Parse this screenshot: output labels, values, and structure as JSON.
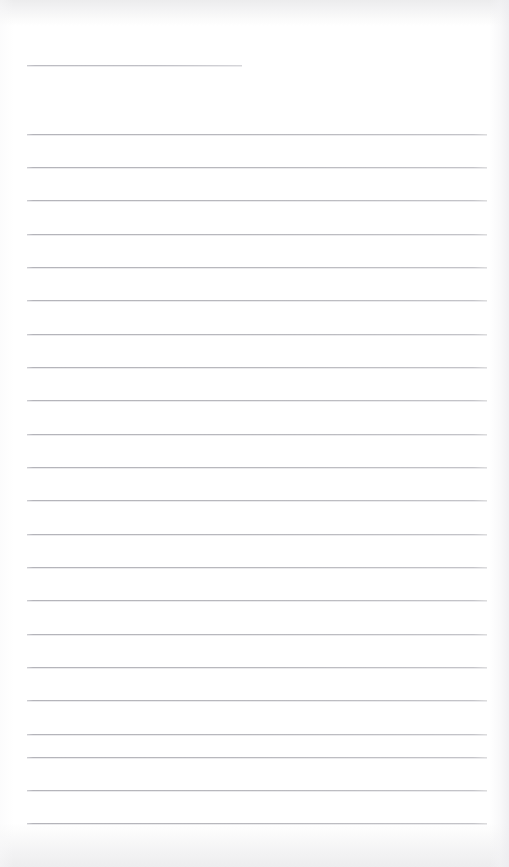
{
  "page": {
    "kind": "lined-paper-sheet",
    "width": 509,
    "height": 867,
    "paper_color": "#ffffff",
    "rule_color": "#b9b9be",
    "edge_shadow_color": "#ededee",
    "content_text": "",
    "is_blank": "true"
  },
  "title_line": {
    "label": "",
    "value": "",
    "placeholder": "",
    "x": 27,
    "y": 65,
    "width": 215
  },
  "rules": {
    "left_margin": 27,
    "right_margin": 487,
    "line_width": 460,
    "spacing": 33.4,
    "first_line_y": 134,
    "count": 22,
    "positions": [
      134,
      167,
      200,
      234,
      267,
      300,
      334,
      367,
      400,
      434,
      467,
      500,
      534,
      567,
      600,
      634,
      667,
      700,
      734,
      757,
      790,
      823
    ]
  },
  "lines": [
    {
      "index": 1,
      "y": 134,
      "text": ""
    },
    {
      "index": 2,
      "y": 167,
      "text": ""
    },
    {
      "index": 3,
      "y": 200,
      "text": ""
    },
    {
      "index": 4,
      "y": 234,
      "text": ""
    },
    {
      "index": 5,
      "y": 267,
      "text": ""
    },
    {
      "index": 6,
      "y": 300,
      "text": ""
    },
    {
      "index": 7,
      "y": 334,
      "text": ""
    },
    {
      "index": 8,
      "y": 367,
      "text": ""
    },
    {
      "index": 9,
      "y": 400,
      "text": ""
    },
    {
      "index": 10,
      "y": 434,
      "text": ""
    },
    {
      "index": 11,
      "y": 467,
      "text": ""
    },
    {
      "index": 12,
      "y": 500,
      "text": ""
    },
    {
      "index": 13,
      "y": 534,
      "text": ""
    },
    {
      "index": 14,
      "y": 567,
      "text": ""
    },
    {
      "index": 15,
      "y": 600,
      "text": ""
    },
    {
      "index": 16,
      "y": 634,
      "text": ""
    },
    {
      "index": 17,
      "y": 667,
      "text": ""
    },
    {
      "index": 18,
      "y": 700,
      "text": ""
    },
    {
      "index": 19,
      "y": 734,
      "text": ""
    },
    {
      "index": 20,
      "y": 757,
      "text": ""
    },
    {
      "index": 21,
      "y": 790,
      "text": ""
    },
    {
      "index": 22,
      "y": 823,
      "text": ""
    }
  ]
}
